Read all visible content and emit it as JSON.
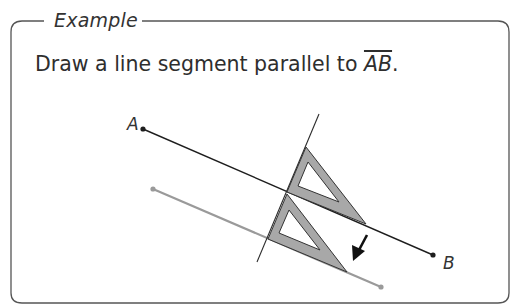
{
  "example": {
    "heading": "Example",
    "prompt_text": "Draw a line segment parallel to ",
    "prompt_segment": "AB",
    "prompt_end": "."
  },
  "figure": {
    "points": {
      "A": {
        "label": "A",
        "x": 143,
        "y": 129
      },
      "B": {
        "label": "B",
        "x": 433,
        "y": 255
      }
    },
    "segment_AB": {
      "color": "#1e1e1e"
    },
    "parallel_segment": {
      "color": "#9a9a9a",
      "x1": 153,
      "y1": 189,
      "x2": 381,
      "y2": 287
    },
    "straightedge": {
      "x1": 319,
      "y1": 114,
      "x2": 257,
      "y2": 262
    },
    "triangle_fill": "#a8a8a8",
    "arrow_direction": "down-left"
  }
}
